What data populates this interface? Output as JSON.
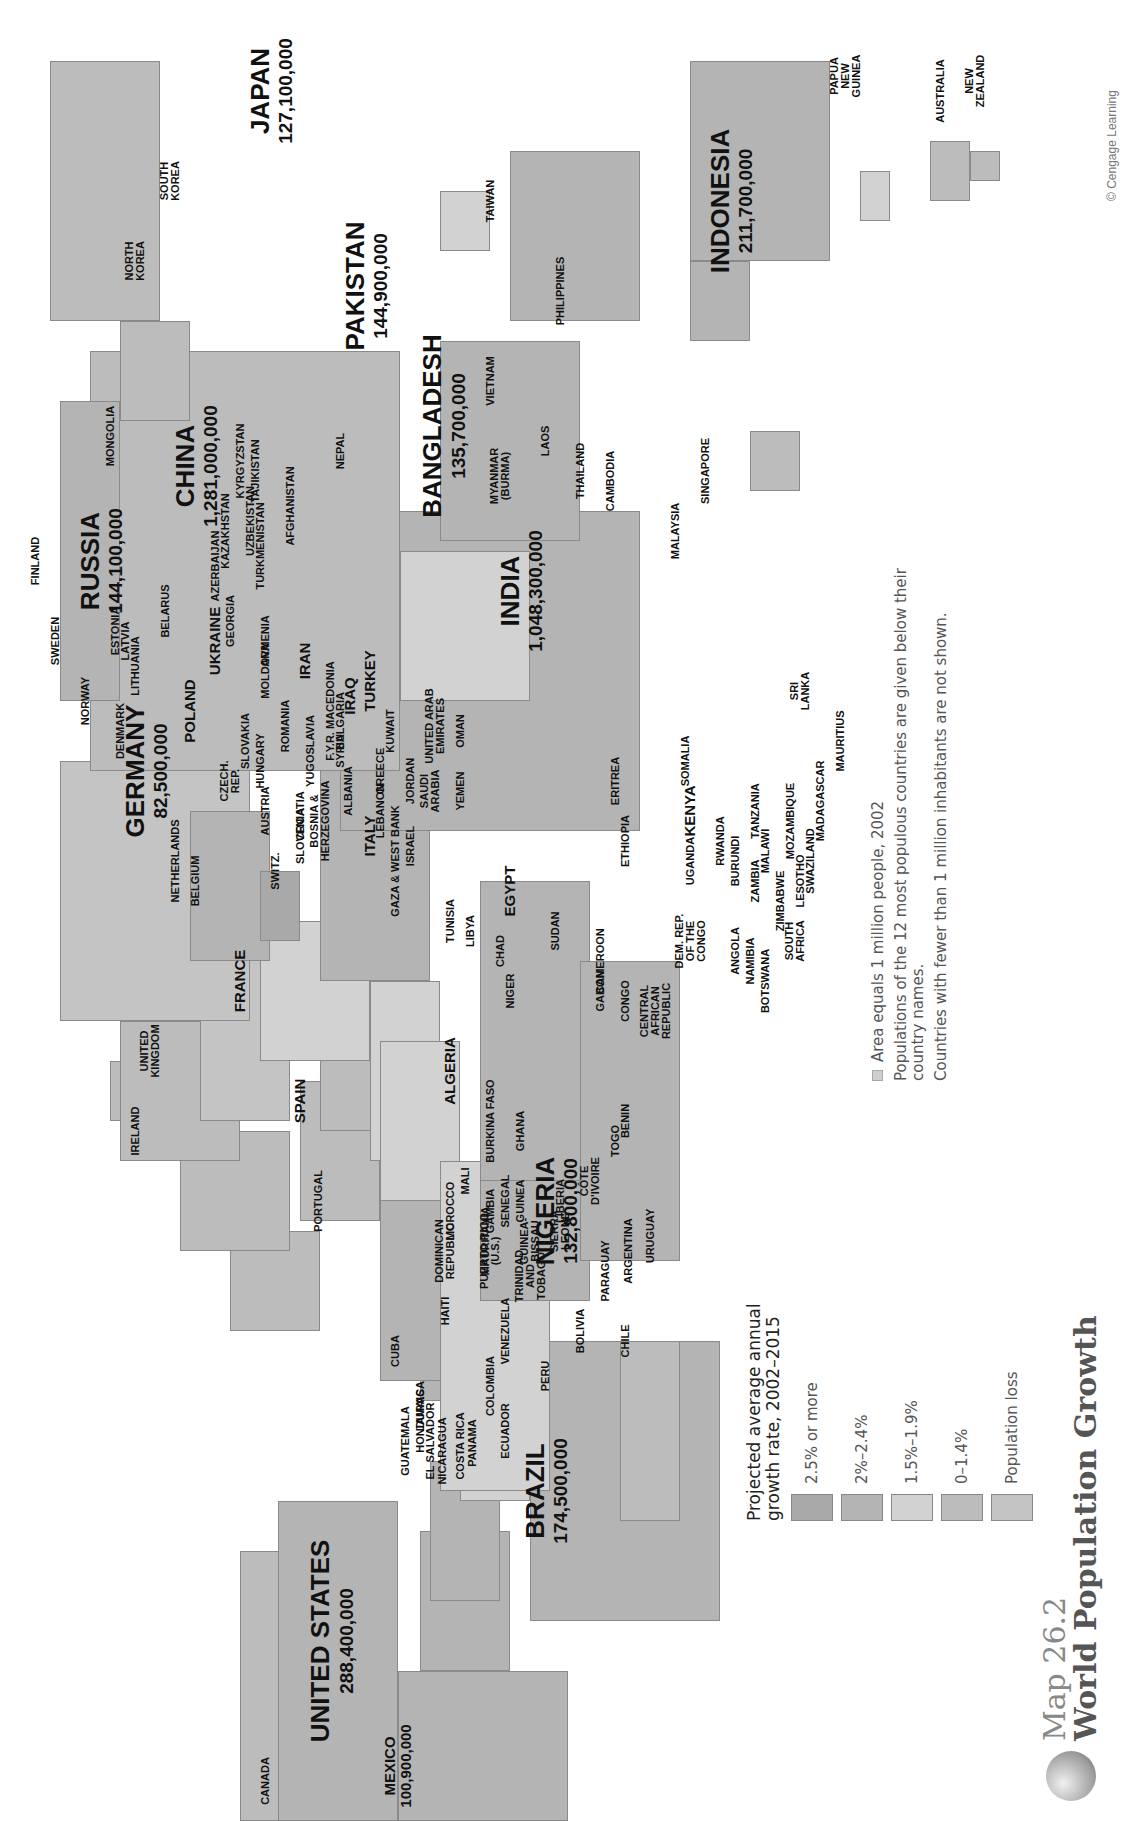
{
  "title": {
    "map_number": "Map 26.2",
    "map_title": "World Population Growth"
  },
  "copyright": "© Cengage Learning",
  "legend": {
    "title_line1": "Projected average annual",
    "title_line2": "growth rate, 2002–2015",
    "items": [
      {
        "label": "2.5% or more",
        "color": "#a9a9a9"
      },
      {
        "label": "2%–2.4%",
        "color": "#b4b4b4"
      },
      {
        "label": "1.5%–1.9%",
        "color": "#d2d2d2"
      },
      {
        "label": "0–1.4%",
        "color": "#bcbcbc"
      },
      {
        "label": "Population loss",
        "color": "#c4c4c4"
      }
    ]
  },
  "notes": {
    "area": "Area equals 1 million people, 2002",
    "populations": "Populations of the 12 most populous countries are given below their country names.",
    "excluded": "Countries with fewer than 1 million inhabitants are not shown."
  },
  "countries_major": [
    {
      "name": "CHINA",
      "population": "1,281,000,000"
    },
    {
      "name": "INDIA",
      "population": "1,048,300,000"
    },
    {
      "name": "UNITED STATES",
      "population": "288,400,000"
    },
    {
      "name": "INDONESIA",
      "population": "211,700,000"
    },
    {
      "name": "BRAZIL",
      "population": "174,500,000"
    },
    {
      "name": "PAKISTAN",
      "population": "144,900,000"
    },
    {
      "name": "RUSSIA",
      "population": "144,100,000"
    },
    {
      "name": "BANGLADESH",
      "population": "135,700,000"
    },
    {
      "name": "NIGERIA",
      "population": "132,800,000"
    },
    {
      "name": "JAPAN",
      "population": "127,100,000"
    },
    {
      "name": "MEXICO",
      "population": "100,900,000"
    },
    {
      "name": "GERMANY",
      "population": "82,500,000"
    }
  ],
  "countries_minor": {
    "canada": "CANADA",
    "cuba": "CUBA",
    "haiti": "HAITI",
    "dominican": "DOMINICAN\nREPUBLIC",
    "puerto_rico": "PUERTO RICO\n(U.S.)",
    "jamaica": "JAMAICA",
    "honduras": "HONDURAS",
    "guatemala": "GUATEMALA",
    "el_salvador": "EL SALVADOR",
    "nicaragua": "NICARAGUA",
    "costa_rica": "COSTA RICA",
    "panama": "PANAMA",
    "trinidad": "TRINIDAD\nAND\nTOBAGO",
    "venezuela": "VENEZUELA",
    "colombia": "COLOMBIA",
    "ecuador": "ECUADOR",
    "peru": "PERU",
    "bolivia": "BOLIVIA",
    "paraguay": "PARAGUAY",
    "chile": "CHILE",
    "argentina": "ARGENTINA",
    "uruguay": "URUGUAY",
    "ireland": "IRELAND",
    "uk": "UNITED\nKINGDOM",
    "portugal": "PORTUGAL",
    "spain": "SPAIN",
    "france": "FRANCE",
    "belgium": "BELGIUM",
    "netherlands": "NETHERLANDS",
    "switz": "SWITZ.",
    "denmark": "DENMARK",
    "norway": "NORWAY",
    "sweden": "SWEDEN",
    "finland": "FINLAND",
    "estonia": "ESTONIA",
    "latvia": "LATVIA",
    "lithuania": "LITHUANIA",
    "poland": "POLAND",
    "czech": "CZECH.\nREP.",
    "slovakia": "SLOVAKIA",
    "austria": "AUSTRIA",
    "hungary": "HUNGARY",
    "slovenia": "SLOVENIA",
    "croatia": "CROATIA",
    "bosnia": "BOSNIA &\nHERZEGOVINA",
    "yugoslavia": "YUGOSLAVIA",
    "albania": "ALBANIA",
    "macedonia": "F.Y.R. MACEDONIA",
    "bulgaria": "BULGARIA",
    "romania": "ROMANIA",
    "moldova": "MOLDOVA",
    "ukraine": "UKRAINE",
    "belarus": "BELARUS",
    "italy": "ITALY",
    "greece": "GREECE",
    "turkey": "TURKEY",
    "georgia": "GEORGIA",
    "armenia": "ARMENIA",
    "azerbaijan": "AZERBAIJAN",
    "kazakhstan": "KAZAKHSTAN",
    "uzbekistan": "UZBEKISTAN",
    "turkmenistan": "TURKMENISTAN",
    "kyrgyzstan": "KYRGYZSTAN",
    "tajikistan": "TAJIKISTAN",
    "afghanistan": "AFGHANISTAN",
    "iran": "IRAN",
    "iraq": "IRAQ",
    "syria": "SYRIA",
    "lebanon": "LEBANON",
    "israel": "ISRAEL",
    "gaza": "GAZA & WEST BANK",
    "jordan": "JORDAN",
    "kuwait": "KUWAIT",
    "saudi": "SAUDI\nARABIA",
    "uae": "UNITED ARAB\nEMIRATES",
    "oman": "OMAN",
    "yemen": "YEMEN",
    "nepal": "NEPAL",
    "sri_lanka": "SRI\nLANKA",
    "mongolia": "MONGOLIA",
    "north_korea": "NORTH\nKOREA",
    "south_korea": "SOUTH\nKOREA",
    "taiwan": "TAIWAN",
    "philippines": "PHILIPPINES",
    "vietnam": "VIETNAM",
    "laos": "LAOS",
    "thailand": "THAILAND",
    "cambodia": "CAMBODIA",
    "myanmar": "MYANMAR\n(BURMA)",
    "malaysia": "MALAYSIA",
    "singapore": "SINGAPORE",
    "papua": "PAPUA\nNEW\nGUINEA",
    "australia": "AUSTRALIA",
    "new_zealand": "NEW\nZEALAND",
    "morocco": "MOROCCO",
    "algeria": "ALGERIA",
    "tunisia": "TUNISIA",
    "libya": "LIBYA",
    "egypt": "EGYPT",
    "mali": "MALI",
    "mauritania": "MAURITANIA",
    "senegal": "SENEGAL",
    "gambia": "GAMBIA",
    "guinea_bissau": "GUINEA-\nBISSAU",
    "guinea": "GUINEA",
    "sierra_leone": "SIERRA\nLEONE",
    "liberia": "LIBERIA",
    "cote": "CÔTE\nD'IVOIRE",
    "burkina": "BURKINA FASO",
    "ghana": "GHANA",
    "togo": "TOGO",
    "benin": "BENIN",
    "niger": "NIGER",
    "chad": "CHAD",
    "sudan": "SUDAN",
    "cameroon": "CAMEROON",
    "car": "CENTRAL\nAFRICAN\nREPUBLIC",
    "gabon": "GABON",
    "congo": "CONGO",
    "drc": "DEM. REP.\nOF THE\nCONGO",
    "angola": "ANGOLA",
    "namibia": "NAMIBIA",
    "botswana": "BOTSWANA",
    "south_africa": "SOUTH\nAFRICA",
    "lesotho": "LESOTHO",
    "swaziland": "SWAZILAND",
    "zimbabwe": "ZIMBABWE",
    "zambia": "ZAMBIA",
    "malawi": "MALAWI",
    "mozambique": "MOZAMBIQUE",
    "madagascar": "MADAGASCAR",
    "mauritius": "MAURITIUS",
    "tanzania": "TANZANIA",
    "burundi": "BURUNDI",
    "rwanda": "RWANDA",
    "uganda": "UGANDA",
    "kenya": "KENYA",
    "ethiopia": "ETHIOPIA",
    "eritrea": "ERITREA",
    "somalia": "SOMALIA"
  }
}
